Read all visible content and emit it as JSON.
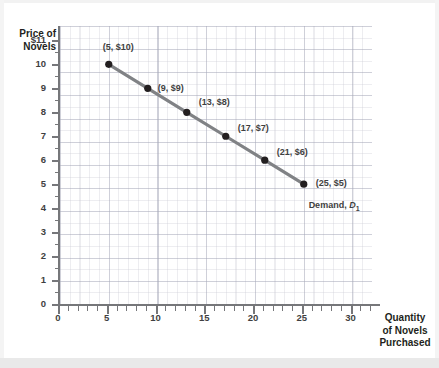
{
  "chart_data": {
    "type": "line",
    "title": "",
    "subtitle": "",
    "xlabel": "Quantity of Novels Purchased",
    "ylabel": "Price of Novels",
    "xlim": [
      0,
      32
    ],
    "ylim": [
      0,
      11.6
    ],
    "grid": true,
    "legend_position": "inline-annotation",
    "x_ticks": [
      0,
      5,
      10,
      15,
      20,
      25,
      30
    ],
    "x_tick_labels": [
      "0",
      "5",
      "10",
      "15",
      "20",
      "25",
      "30"
    ],
    "x_minor_tick_step": 1,
    "y_ticks": [
      0,
      1,
      2,
      3,
      4,
      5,
      6,
      7,
      8,
      9,
      10,
      11
    ],
    "y_tick_labels": [
      "0",
      "1",
      "2",
      "3",
      "4",
      "5",
      "6",
      "7",
      "8",
      "9",
      "10",
      "$11"
    ],
    "y_minor_tick_step": 0.5,
    "series": [
      {
        "name": "Demand, D1",
        "color": "#808285",
        "marker_color": "#231f20",
        "x": [
          5,
          9,
          13,
          17,
          21,
          25
        ],
        "y": [
          10,
          9,
          8,
          7,
          6,
          5
        ],
        "point_labels": [
          "(5, $10)",
          "(9, $9)",
          "(13, $8)",
          "(17, $7)",
          "(21, $6)",
          "(25, $5)"
        ]
      }
    ],
    "annotations": [
      {
        "text_prefix": "Demand, ",
        "text_italic": "D",
        "text_sub": "1",
        "x": 25.5,
        "y": 4.1
      }
    ]
  },
  "axis": {
    "y_title_line1": "Price of",
    "y_title_line2": "Novels",
    "x_title_line1": "Quantity",
    "x_title_line2": "of Novels",
    "x_title_line3": "Purchased"
  },
  "colors": {
    "line": "#808285",
    "marker": "#231f20",
    "axis": "#76777a",
    "text": "#231f20",
    "grid": "#9a9ab0",
    "background": "#ffffff"
  }
}
